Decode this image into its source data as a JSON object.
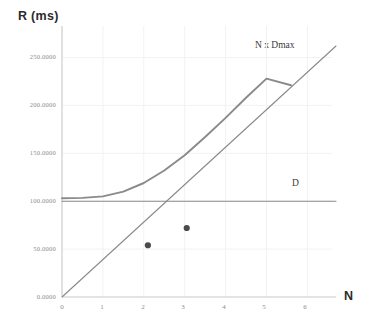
{
  "chart_data": {
    "type": "line",
    "title": "",
    "xlabel": "N",
    "ylabel": "R (ms)",
    "xlim": [
      0,
      6.7
    ],
    "ylim": [
      0,
      262
    ],
    "grid": true,
    "legend_position": "inline-annotations",
    "x_ticks": [
      "0",
      "1",
      "2",
      "3",
      "4",
      "5",
      "6"
    ],
    "x_tick_values": [
      0,
      1,
      2,
      3,
      4,
      5,
      6
    ],
    "y_ticks": [
      "0.0000",
      "50.0000",
      "100.0000",
      "150.0000",
      "200.0000",
      "250.0000"
    ],
    "y_tick_values": [
      0,
      50,
      100,
      150,
      200,
      250
    ],
    "series": [
      {
        "name": "N x Dmax",
        "kind": "line",
        "color": "#8a8a8a",
        "x": [
          0,
          6.7
        ],
        "values": [
          0,
          262
        ]
      },
      {
        "name": "D",
        "kind": "line",
        "color": "#8a8a8a",
        "x": [
          0,
          6.7
        ],
        "values": [
          100,
          100
        ]
      },
      {
        "name": "R",
        "kind": "curve",
        "color": "#8a8a8a",
        "x": [
          0,
          0.5,
          1,
          1.5,
          2,
          2.5,
          3,
          3.5,
          4,
          4.5,
          5,
          5.6
        ],
        "values": [
          103,
          103.5,
          105,
          110,
          119,
          132,
          148,
          167,
          187,
          208,
          228,
          221
        ]
      },
      {
        "name": "measured",
        "kind": "scatter",
        "color": "#4a4a4a",
        "x": [
          2.1,
          3.05
        ],
        "values": [
          54,
          72
        ]
      }
    ],
    "annotations": [
      {
        "text": "N x Dmax",
        "x": 5.0,
        "y": 243
      },
      {
        "text": "D",
        "x": 5.9,
        "y": 112
      }
    ]
  },
  "axes": {
    "y_title": "R (ms)",
    "x_title": "N"
  }
}
